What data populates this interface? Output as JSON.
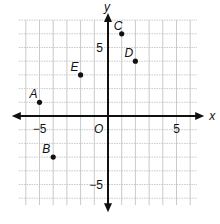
{
  "chart_data": {
    "type": "scatter",
    "title": "",
    "xlabel": "x",
    "ylabel": "y",
    "origin_label": "O",
    "xlim": [
      -6,
      6
    ],
    "ylim": [
      -6,
      7
    ],
    "grid": true,
    "tick_labels": {
      "x": [
        {
          "value": -5,
          "label": "−5"
        },
        {
          "value": 5,
          "label": "5"
        }
      ],
      "y": [
        {
          "value": 5,
          "label": "5"
        },
        {
          "value": -5,
          "label": "−5"
        }
      ]
    },
    "points": [
      {
        "label": "A",
        "x": -5,
        "y": 1
      },
      {
        "label": "B",
        "x": -4,
        "y": -3
      },
      {
        "label": "C",
        "x": 1,
        "y": 6
      },
      {
        "label": "D",
        "x": 2,
        "y": 4
      },
      {
        "label": "E",
        "x": -2,
        "y": 3
      }
    ],
    "colors": {
      "axis": "#111111",
      "grid": "#bdbdbd",
      "point": "#111111"
    }
  }
}
